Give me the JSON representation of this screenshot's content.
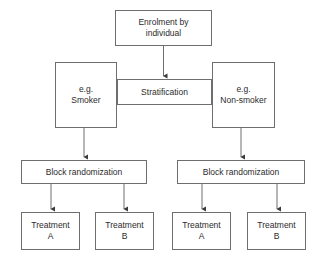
{
  "diagram": {
    "line_color": "#6e6e6e",
    "text_color": "#2b2b2b",
    "background_color": "#ffffff"
  },
  "nodes": {
    "enrolment": {
      "line1": "Enrolment by",
      "line2": "individual"
    },
    "smoker": {
      "line1": "e.g.",
      "line2": "Smoker"
    },
    "stratification": {
      "label": "Stratification"
    },
    "nonsmoker": {
      "line1": "e.g.",
      "line2": "Non-smoker"
    },
    "block_left": {
      "label": "Block randomization"
    },
    "block_right": {
      "label": "Block randomization"
    },
    "treatment_left_a": {
      "line1": "Treatment",
      "line2": "A"
    },
    "treatment_left_b": {
      "line1": "Treatment",
      "line2": "B"
    },
    "treatment_right_a": {
      "line1": "Treatment",
      "line2": "A"
    },
    "treatment_right_b": {
      "line1": "Treatment",
      "line2": "B"
    }
  },
  "connectors": [
    {
      "name": "enrolment-to-stratification",
      "type": "arrow"
    },
    {
      "name": "smoker-to-stratification-top",
      "type": "line"
    },
    {
      "name": "smoker-to-stratification-bottom",
      "type": "line"
    },
    {
      "name": "stratification-to-nonsmoker-top",
      "type": "line"
    },
    {
      "name": "stratification-to-nonsmoker-bottom",
      "type": "line"
    },
    {
      "name": "smoker-to-block-left",
      "type": "arrow"
    },
    {
      "name": "nonsmoker-to-block-right",
      "type": "arrow"
    },
    {
      "name": "block-left-to-treatment-a",
      "type": "arrow"
    },
    {
      "name": "block-left-to-treatment-b",
      "type": "arrow"
    },
    {
      "name": "block-right-to-treatment-a",
      "type": "arrow"
    },
    {
      "name": "block-right-to-treatment-b",
      "type": "arrow"
    }
  ]
}
